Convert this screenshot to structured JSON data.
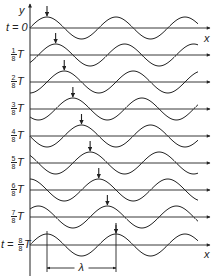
{
  "diagram": {
    "axes": {
      "y_label": "y",
      "x_label": "x"
    },
    "rows": [
      {
        "label_prefix": "t = ",
        "numerator": "",
        "denominator": "",
        "label": "0",
        "suffix": "",
        "fraction": 0
      },
      {
        "label_prefix": "",
        "numerator": "1",
        "denominator": "8",
        "suffix": "T",
        "fraction": 0.125
      },
      {
        "label_prefix": "",
        "numerator": "2",
        "denominator": "8",
        "suffix": "T",
        "fraction": 0.25
      },
      {
        "label_prefix": "",
        "numerator": "3",
        "denominator": "8",
        "suffix": "T",
        "fraction": 0.375
      },
      {
        "label_prefix": "",
        "numerator": "4",
        "denominator": "8",
        "suffix": "T",
        "fraction": 0.5
      },
      {
        "label_prefix": "",
        "numerator": "5",
        "denominator": "8",
        "suffix": "T",
        "fraction": 0.625
      },
      {
        "label_prefix": "",
        "numerator": "6",
        "denominator": "8",
        "suffix": "T",
        "fraction": 0.75
      },
      {
        "label_prefix": "",
        "numerator": "7",
        "denominator": "8",
        "suffix": "T",
        "fraction": 0.875
      },
      {
        "label_prefix": "t = ",
        "numerator": "8",
        "denominator": "8",
        "suffix": "T",
        "fraction": 1.0
      }
    ],
    "wavelength_label": "λ",
    "colors": {
      "ink": "#222222",
      "background": "#ffffff"
    }
  }
}
